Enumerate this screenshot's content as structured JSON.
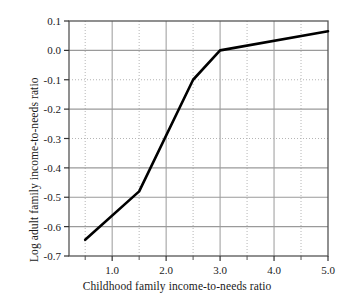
{
  "chart_data": {
    "type": "line",
    "title": "",
    "xlabel": "Childhood family income-to-needs ratio",
    "ylabel": "Log adult family income-to-needs ratio",
    "xlim": [
      0.2,
      5.0
    ],
    "ylim": [
      -0.7,
      0.1
    ],
    "x": [
      0.5,
      1.5,
      2.5,
      3.0,
      5.0
    ],
    "values": [
      -0.645,
      -0.48,
      -0.1,
      0.0,
      0.065
    ],
    "series": [
      {
        "name": "Log adult family income-to-needs ratio",
        "x": [
          0.5,
          1.5,
          2.5,
          3.0,
          5.0
        ],
        "values": [
          -0.645,
          -0.48,
          -0.1,
          0.0,
          0.065
        ]
      }
    ],
    "xticks": [
      1.0,
      2.0,
      3.0,
      4.0,
      5.0
    ],
    "xticklabels": [
      "1.0",
      "2.0",
      "3.0",
      "4.0",
      "5.0"
    ],
    "xminorticks": [
      0.5,
      1.5,
      2.5,
      3.5,
      4.5
    ],
    "yticks": [
      0.1,
      0.0,
      -0.1,
      -0.2,
      -0.3,
      -0.4,
      -0.5,
      -0.6,
      -0.7
    ],
    "yticklabels": [
      "0.1",
      "0.0",
      "-0.1",
      "-0.2",
      "-0.3",
      "-0.4",
      "-0.5",
      "-0.6",
      "-0.7"
    ],
    "grid": true,
    "grid_major_color": "#9a9a9a",
    "grid_minor_color": "#b5b5b5",
    "line_color": "#000000",
    "line_width": 2.6,
    "frame_color": "#555555",
    "background": "#ffffff",
    "legend": "none"
  }
}
